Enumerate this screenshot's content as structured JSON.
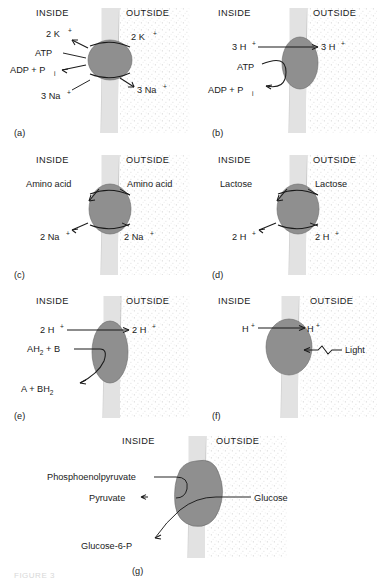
{
  "figure": {
    "caption": "FIGURE 3",
    "colors": {
      "membrane": "#e2e2e2",
      "protein": "#8f8f8f",
      "stipple": "#f1f1f1",
      "ink": "#1a1a1a"
    },
    "side_labels": {
      "inside": "INSIDE",
      "outside": "OUTSIDE"
    }
  },
  "panels": [
    {
      "id": "(a)",
      "name": "sodium-potassium-atpase",
      "inside": "INSIDE",
      "outside": "OUTSIDE",
      "labels": {
        "k_in": "2 K",
        "k_in_sup": "+",
        "k_out": "2 K",
        "k_out_sup": "+",
        "atp": "ATP",
        "adp": "ADP + P",
        "adp_sub": "i",
        "na_in": "3 Na",
        "na_in_sup": "+",
        "na_out": "3 Na",
        "na_out_sup": "+"
      }
    },
    {
      "id": "(b)",
      "name": "atp-synthase",
      "inside": "INSIDE",
      "outside": "OUTSIDE",
      "labels": {
        "h_in": "3 H",
        "h_in_sup": "+",
        "h_out": "3 H",
        "h_out_sup": "+",
        "atp": "ATP",
        "adp": "ADP + P",
        "adp_sub": "i"
      }
    },
    {
      "id": "(c)",
      "name": "amino-acid-sodium-symporter",
      "inside": "INSIDE",
      "outside": "OUTSIDE",
      "labels": {
        "solute_in": "Amino acid",
        "solute_out": "Amino acid",
        "ion_in": "2 Na",
        "ion_in_sup": "+",
        "ion_out": "2 Na",
        "ion_out_sup": "+"
      }
    },
    {
      "id": "(d)",
      "name": "lactose-proton-symporter",
      "inside": "INSIDE",
      "outside": "OUTSIDE",
      "labels": {
        "solute_in": "Lactose",
        "solute_out": "Lactose",
        "ion_in": "2 H",
        "ion_in_sup": "+",
        "ion_out": "2 H",
        "ion_out_sup": "+"
      }
    },
    {
      "id": "(e)",
      "name": "redox-driven-proton-pump",
      "inside": "INSIDE",
      "outside": "OUTSIDE",
      "labels": {
        "h_in": "2 H",
        "h_in_sup": "+",
        "h_out": "2 H",
        "h_out_sup": "+",
        "donor": "AH",
        "donor_sub": "2",
        "donor_tail": " + B",
        "product": "A + BH",
        "product_sub": "2"
      }
    },
    {
      "id": "(f)",
      "name": "light-driven-proton-pump",
      "inside": "INSIDE",
      "outside": "OUTSIDE",
      "labels": {
        "h_in": "H",
        "h_in_sup": "+",
        "h_out": "H",
        "h_out_sup": "+",
        "light": "Light"
      }
    },
    {
      "id": "(g)",
      "name": "pts-group-translocation",
      "inside": "INSIDE",
      "outside": "OUTSIDE",
      "labels": {
        "pep": "Phosphoenolpyruvate",
        "pyruvate": "Pyruvate",
        "glucose": "Glucose",
        "g6p": "Glucose-6-P"
      }
    }
  ]
}
